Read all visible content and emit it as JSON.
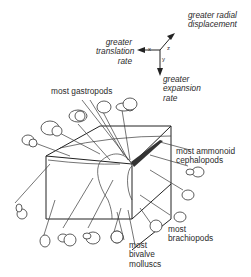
{
  "axes": {
    "z_label": "greater radial displacement",
    "z_line1": "greater radial",
    "z_line2": "displacement",
    "x_label": "greater translation rate",
    "x_line1": "greater",
    "x_line2": "translation",
    "x_line3": "rate",
    "y_label": "greater expansion rate",
    "y_line1": "greater",
    "y_line2": "expansion",
    "y_line3": "rate",
    "x_letter": "x",
    "y_letter": "y",
    "z_letter": "z"
  },
  "labels": {
    "gastropods": "most gastropods",
    "ammonoid_line1": "most ammonoid",
    "ammonoid_line2": "cephalopods",
    "brachiopods_line1": "most",
    "brachiopods_line2": "brachiopods",
    "bivalve_line1": "most",
    "bivalve_line2": "bivalve",
    "bivalve_line3": "molluscs"
  },
  "colors": {
    "ink": "#2a2a2a",
    "background": "#ffffff"
  }
}
